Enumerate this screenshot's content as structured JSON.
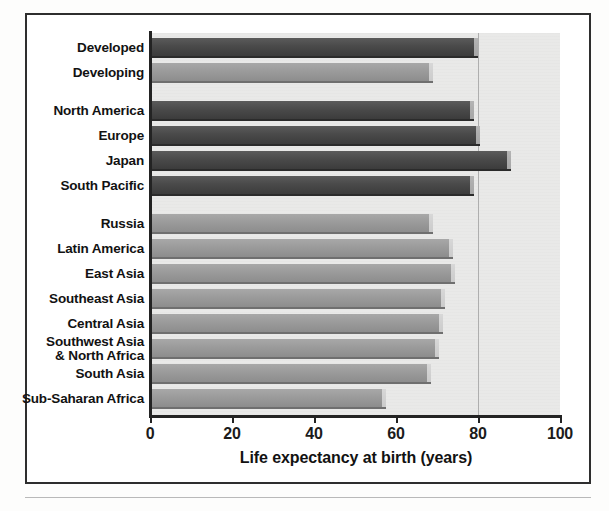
{
  "chart_data": {
    "type": "bar",
    "orientation": "horizontal",
    "title": "",
    "xlabel": "Life expectancy at birth (years)",
    "ylabel": "",
    "xlim": [
      0,
      100
    ],
    "xticks": [
      "0",
      "20",
      "40",
      "60",
      "80",
      "100"
    ],
    "xtick_values": [
      0,
      20,
      40,
      60,
      80,
      100
    ],
    "grid": "vertical gridline at 80",
    "gridlines": [
      80
    ],
    "legend": "none",
    "categories": [
      "Developed",
      "Developing",
      "North America",
      "Europe",
      "Japan",
      "South Pacific",
      "Russia",
      "Latin America",
      "East Asia",
      "Southeast Asia",
      "Central Asia",
      "Southwest Asia\n& North Africa",
      "South Asia",
      "Sub-Saharan Africa"
    ],
    "values": [
      80,
      69,
      79,
      80.5,
      88,
      79,
      69,
      74,
      74.5,
      72,
      71.5,
      70.5,
      68.5,
      57.5
    ],
    "bar_groups": [
      "dark",
      "light",
      "dark",
      "dark",
      "dark",
      "dark",
      "light",
      "light",
      "light",
      "light",
      "light",
      "light",
      "light",
      "light"
    ],
    "group_gaps_after": [
      "Developing",
      "South Pacific"
    ],
    "colors": {
      "dark_bar": "#4a4a4a",
      "light_bar": "#9b9b9b",
      "plot_background": "#e9e9e8",
      "axis": "#232323",
      "gridline": "#aeaeae",
      "frame": "#2e2e2e",
      "text": "#121212"
    }
  }
}
